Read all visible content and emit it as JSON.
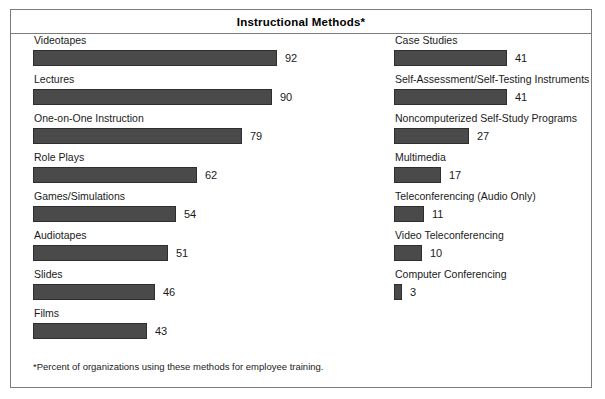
{
  "chart_data": {
    "type": "bar",
    "title": "Instructional Methods*",
    "orientation": "horizontal",
    "xlabel": "",
    "ylabel": "",
    "xlim": [
      0,
      100
    ],
    "grid": false,
    "legend": null,
    "annotations": [
      "*Percent of organizations using these methods for employee training."
    ],
    "categories": [
      "Videotapes",
      "Lectures",
      "One-on-One Instruction",
      "Role Plays",
      "Games/Simulations",
      "Audiotapes",
      "Slides",
      "Films",
      "Case Studies",
      "Self-Assessment/Self-Testing Instruments",
      "Noncomputerized Self-Study Programs",
      "Multimedia",
      "Teleconferencing (Audio Only)",
      "Video Teleconferencing",
      "Computer Conferencing"
    ],
    "values": [
      92,
      90,
      79,
      62,
      54,
      51,
      46,
      43,
      41,
      41,
      27,
      17,
      11,
      10,
      3
    ],
    "columns": {
      "left": [
        {
          "label": "Videotapes",
          "value": 92
        },
        {
          "label": "Lectures",
          "value": 90
        },
        {
          "label": "One-on-One Instruction",
          "value": 79
        },
        {
          "label": "Role Plays",
          "value": 62
        },
        {
          "label": "Games/Simulations",
          "value": 54
        },
        {
          "label": "Audiotapes",
          "value": 51
        },
        {
          "label": "Slides",
          "value": 46
        },
        {
          "label": "Films",
          "value": 43
        }
      ],
      "right": [
        {
          "label": "Case Studies",
          "value": 41
        },
        {
          "label": "Self-Assessment/Self-Testing Instruments",
          "value": 41
        },
        {
          "label": "Noncomputerized Self-Study Programs",
          "value": 27
        },
        {
          "label": "Multimedia",
          "value": 17
        },
        {
          "label": "Teleconferencing (Audio Only)",
          "value": 11
        },
        {
          "label": "Video Teleconferencing",
          "value": 10
        },
        {
          "label": "Computer Conferencing",
          "value": 3
        }
      ]
    },
    "scale_px_per_unit": {
      "left": 2.65,
      "right": 2.76
    },
    "colors": {
      "bar_fill": "#4a4a4a",
      "bar_stroke": "#2e2e2e",
      "frame": "#7b7b7b",
      "text": "#1a1a1a",
      "background": "#ffffff"
    }
  },
  "footnote": "*Percent of organizations using these methods for employee training."
}
